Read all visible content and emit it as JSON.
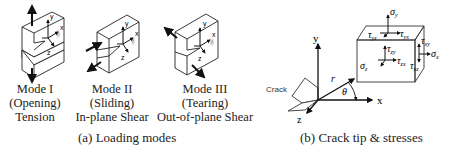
{
  "panel_a": {
    "caption": "(a) Loading modes",
    "modes": [
      {
        "name": "Mode I",
        "subtitle": "(Opening)",
        "description": "Tension"
      },
      {
        "name": "Mode II",
        "subtitle": "(Sliding)",
        "description": "In-plane Shear"
      },
      {
        "name": "Mode III",
        "subtitle": "(Tearing)",
        "description": "Out-of-plane Shear"
      }
    ],
    "axis_labels": {
      "x": "x",
      "y": "y",
      "z": "z"
    }
  },
  "panel_b": {
    "caption": "(b) Crack tip & stresses",
    "crack_label": "Crack",
    "axis_labels": {
      "x": "x",
      "y": "y",
      "z": "z"
    },
    "polar": {
      "r": "r",
      "theta": "θ"
    },
    "stresses": {
      "sigma_y": "σ",
      "sigma_y_sub": "y",
      "tau_yz": "τ",
      "tau_yz_sub": "yz",
      "tau_yx": "τ",
      "tau_yx_sub": "yx",
      "tau_zy": "τ",
      "tau_zy_sub": "zy",
      "tau_zx": "τ",
      "tau_zx_sub": "zx",
      "sigma_z": "σ",
      "sigma_z_sub": "z",
      "tau_xy": "τ",
      "tau_xy_sub": "xy",
      "sigma_x": "σ",
      "sigma_x_sub": "x",
      "tau_xz": "τ",
      "tau_xz_sub": "xz"
    }
  }
}
